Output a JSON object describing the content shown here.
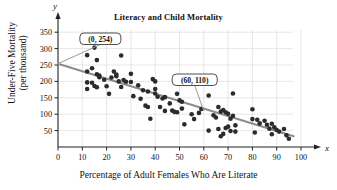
{
  "chart_data": {
    "type": "scatter",
    "title": "Literacy and Child Mortality",
    "xlabel": "Percentage of Adult Females Who Are Literate",
    "ylabel": "Under-Five Mortality",
    "ylabel_line2": "(per thousand)",
    "x_axis_name": "x",
    "y_axis_name": "y",
    "xlim": [
      0,
      100
    ],
    "ylim": [
      0,
      375
    ],
    "xticks": [
      0,
      10,
      20,
      30,
      40,
      50,
      60,
      70,
      80,
      90,
      100
    ],
    "yticks": [
      50,
      100,
      150,
      200,
      250,
      300,
      350
    ],
    "grid": true,
    "legend": "none",
    "point_color": "#2b2b2b",
    "line_color": "#8c8c8c",
    "trendline": {
      "label": "regression line",
      "x": [
        0,
        97
      ],
      "y": [
        254,
        33
      ],
      "endpoints": [
        {
          "x": 0,
          "y": 254
        },
        {
          "x": 97,
          "y": 33
        }
      ]
    },
    "annotations": [
      {
        "label": "(0, 254)",
        "point": {
          "x": 0,
          "y": 254
        },
        "box_x": 9,
        "box_y": 330
      },
      {
        "label": "(60, 110)",
        "point": {
          "x": 60,
          "y": 110
        },
        "box_x": 47,
        "box_y": 205
      }
    ],
    "points": [
      {
        "x": 12,
        "y": 280
      },
      {
        "x": 12,
        "y": 230
      },
      {
        "x": 12,
        "y": 197
      },
      {
        "x": 12,
        "y": 177
      },
      {
        "x": 14,
        "y": 240
      },
      {
        "x": 14,
        "y": 196
      },
      {
        "x": 15,
        "y": 303
      },
      {
        "x": 16,
        "y": 265
      },
      {
        "x": 16,
        "y": 222
      },
      {
        "x": 17,
        "y": 218
      },
      {
        "x": 17,
        "y": 213
      },
      {
        "x": 15,
        "y": 186
      },
      {
        "x": 16,
        "y": 182
      },
      {
        "x": 19,
        "y": 205
      },
      {
        "x": 20,
        "y": 185
      },
      {
        "x": 21,
        "y": 162
      },
      {
        "x": 22,
        "y": 212
      },
      {
        "x": 23,
        "y": 230
      },
      {
        "x": 24,
        "y": 221
      },
      {
        "x": 24,
        "y": 216
      },
      {
        "x": 25,
        "y": 200
      },
      {
        "x": 26,
        "y": 279
      },
      {
        "x": 26,
        "y": 183
      },
      {
        "x": 27,
        "y": 204
      },
      {
        "x": 28,
        "y": 199
      },
      {
        "x": 30,
        "y": 223
      },
      {
        "x": 30,
        "y": 198
      },
      {
        "x": 31,
        "y": 155
      },
      {
        "x": 33,
        "y": 188
      },
      {
        "x": 34,
        "y": 147
      },
      {
        "x": 35,
        "y": 173
      },
      {
        "x": 36,
        "y": 126
      },
      {
        "x": 37,
        "y": 169
      },
      {
        "x": 37,
        "y": 122
      },
      {
        "x": 38,
        "y": 86
      },
      {
        "x": 39,
        "y": 207
      },
      {
        "x": 40,
        "y": 200
      },
      {
        "x": 40,
        "y": 177
      },
      {
        "x": 40,
        "y": 163
      },
      {
        "x": 41,
        "y": 153
      },
      {
        "x": 42,
        "y": 122
      },
      {
        "x": 43,
        "y": 148
      },
      {
        "x": 44,
        "y": 152
      },
      {
        "x": 44,
        "y": 110
      },
      {
        "x": 46,
        "y": 133
      },
      {
        "x": 47,
        "y": 111
      },
      {
        "x": 48,
        "y": 107
      },
      {
        "x": 49,
        "y": 162
      },
      {
        "x": 49,
        "y": 106
      },
      {
        "x": 50,
        "y": 142
      },
      {
        "x": 51,
        "y": 138
      },
      {
        "x": 51,
        "y": 117
      },
      {
        "x": 52,
        "y": 69
      },
      {
        "x": 55,
        "y": 100
      },
      {
        "x": 56,
        "y": 85
      },
      {
        "x": 58,
        "y": 104
      },
      {
        "x": 59,
        "y": 116
      },
      {
        "x": 62,
        "y": 157
      },
      {
        "x": 62,
        "y": 50
      },
      {
        "x": 64,
        "y": 97
      },
      {
        "x": 65,
        "y": 90
      },
      {
        "x": 66,
        "y": 122
      },
      {
        "x": 66,
        "y": 55
      },
      {
        "x": 67,
        "y": 108
      },
      {
        "x": 67,
        "y": 33
      },
      {
        "x": 68,
        "y": 113
      },
      {
        "x": 68,
        "y": 40
      },
      {
        "x": 69,
        "y": 106
      },
      {
        "x": 69,
        "y": 58
      },
      {
        "x": 70,
        "y": 101
      },
      {
        "x": 70,
        "y": 62
      },
      {
        "x": 71,
        "y": 86
      },
      {
        "x": 71,
        "y": 49
      },
      {
        "x": 72,
        "y": 163
      },
      {
        "x": 72,
        "y": 95
      },
      {
        "x": 73,
        "y": 66
      },
      {
        "x": 73,
        "y": 47
      },
      {
        "x": 80,
        "y": 115
      },
      {
        "x": 80,
        "y": 85
      },
      {
        "x": 81,
        "y": 44
      },
      {
        "x": 82,
        "y": 83
      },
      {
        "x": 83,
        "y": 72
      },
      {
        "x": 85,
        "y": 80
      },
      {
        "x": 86,
        "y": 68
      },
      {
        "x": 87,
        "y": 56
      },
      {
        "x": 88,
        "y": 71
      },
      {
        "x": 88,
        "y": 39
      },
      {
        "x": 89,
        "y": 60
      },
      {
        "x": 90,
        "y": 52
      },
      {
        "x": 91,
        "y": 47
      },
      {
        "x": 93,
        "y": 55
      },
      {
        "x": 94,
        "y": 36
      },
      {
        "x": 95,
        "y": 25
      }
    ]
  },
  "page": {
    "cropped_header_sliver": ""
  }
}
